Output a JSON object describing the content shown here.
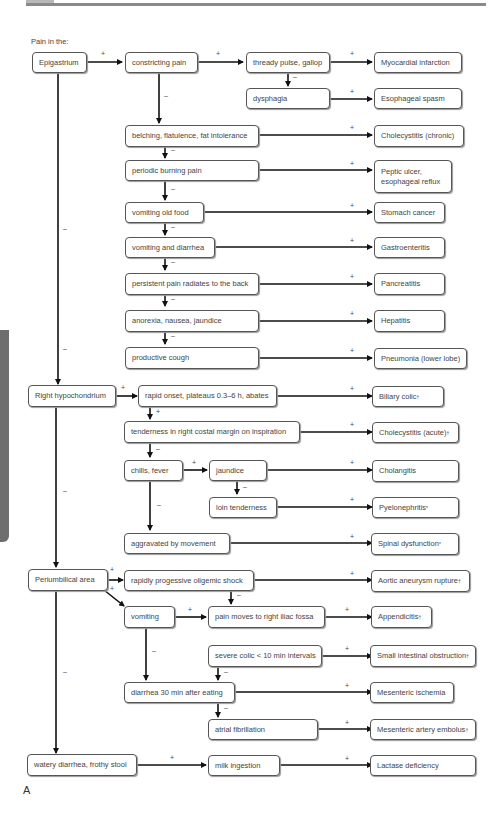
{
  "heading": "Pain in the:",
  "panel_label": "A",
  "signs": {
    "plus": "+",
    "minus": "–"
  },
  "regions": {
    "epigastrium": "Epigastrium",
    "right_hypochondrium": "Right hypochondrium",
    "periumbilical": "Periumbilical area",
    "watery": "watery diarrhea, frothy stool"
  },
  "findings": {
    "constricting_pain": "constricting pain",
    "thready_pulse": "thready pulse, gallop",
    "dysphagia": "dysphagia",
    "belching": "belching, flatulence, fat intolerance",
    "periodic_burning": "periodic burning pain",
    "vomiting_old_food": "vomiting old food",
    "vomiting_diarrhea": "vomiting and diarrhea",
    "persistent_pain": "persistent pain radiates to the back",
    "anorexia": "anorexia, nausea, jaundice",
    "productive_cough": "productive cough",
    "rapid_onset": "rapid onset, plateaus 0.3–6 h, abates",
    "tenderness_costal": "tenderness in right costal margin on inspiration",
    "chills_fever": "chills, fever",
    "jaundice": "jaundice",
    "loin_tenderness": "loin tenderness",
    "aggravated": "aggravated by movement",
    "oligemic_shock": "rapidly progessive oligemic shock",
    "vomiting": "vomiting",
    "pain_moves": "pain moves to right iliac fossa",
    "severe_colic": "severe colic < 10 min intervals",
    "diarrhea_30": "diarrhea 30 min after eating",
    "atrial_fib": "atrial fibrillation",
    "milk": "milk ingestion"
  },
  "diagnoses": {
    "mi": "Myocardial infarction",
    "esophageal_spasm": "Esophageal spasm",
    "cholecystitis_chronic": "Cholecystitis (chronic)",
    "peptic_ulcer": "Peptic ulcer, esophageal reflux",
    "stomach_cancer": "Stomach cancer",
    "gastroenteritis": "Gastroenteritis",
    "pancreatitis": "Pancreatitis",
    "hepatitis": "Hepatitis",
    "pneumonia": "Pneumonia (lower lobe)",
    "biliary_colic": "Biliary colic",
    "cholecystitis_acute": "Cholecystitis (acute)",
    "cholangitis": "Cholangitis",
    "pyelonephritis": "Pyelonephritis",
    "spinal": "Spinal dysfunction",
    "aortic": "Aortic aneurysm rupture",
    "appendicitis": "Appendicitis",
    "small_intestinal": "Small intestinal obstruction",
    "mesenteric_ischemia": "Mesenteric ischemia",
    "mesenteric_embolus": "Mesenteric artery embolus",
    "lactase": "Lactase deficiency"
  },
  "marks": {
    "dagger": "†",
    "asterisk": "*"
  },
  "colors": {
    "line": "#111111",
    "border": "#555555",
    "text": "#444444",
    "side_tab": "#6e6e6e"
  }
}
